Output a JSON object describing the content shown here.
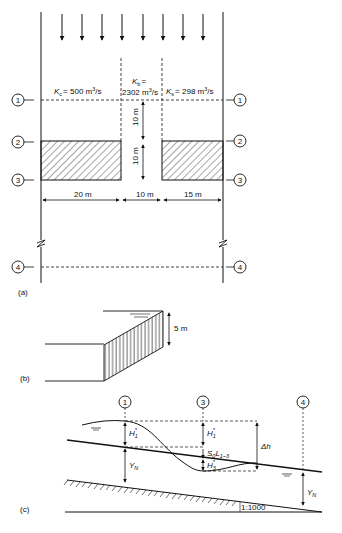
{
  "panel_a": {
    "label": "(a)",
    "sections": [
      {
        "id": "1",
        "y": 100
      },
      {
        "id": "2",
        "y": 142
      },
      {
        "id": "3",
        "y": 180
      },
      {
        "id": "4",
        "y": 268
      }
    ],
    "conveyance": {
      "left": {
        "symbol": "K",
        "sub": "c",
        "value": "= 500 m",
        "unit_sup": "3",
        "unit_tail": "/s"
      },
      "middle": {
        "symbol": "K",
        "sub": "b",
        "eq": "=",
        "value": "2302 m",
        "unit_sup": "3",
        "unit_tail": "/s"
      },
      "right": {
        "symbol": "K",
        "sub": "s",
        "value": "= 298 m",
        "unit_sup": "3",
        "unit_tail": "/s"
      }
    },
    "vertical_dims": [
      "10 m",
      "10 m"
    ],
    "horizontal_dims": [
      "20 m",
      "10 m",
      "15 m"
    ],
    "flow_arrow_count": 8
  },
  "panel_b": {
    "label": "(b)",
    "height_dim": "5 m"
  },
  "panel_c": {
    "label": "(c)",
    "sections": [
      "1",
      "3",
      "4"
    ],
    "labels": {
      "h1_left": "H",
      "h1_left_sub": "1",
      "h1_right": "H",
      "h1_right_sub": "1",
      "slope_term": "S",
      "slope_term_sub0": "0",
      "slope_term_L": "L",
      "slope_term_sub": "1–3",
      "h3": "H",
      "h3_sub": "3",
      "star": "*",
      "delta_h": "Δh",
      "yn_left": "Y",
      "yn_left_sub": "N",
      "yn_right": "Y",
      "yn_right_sub": "N",
      "bed_slope": "1:1000"
    }
  }
}
